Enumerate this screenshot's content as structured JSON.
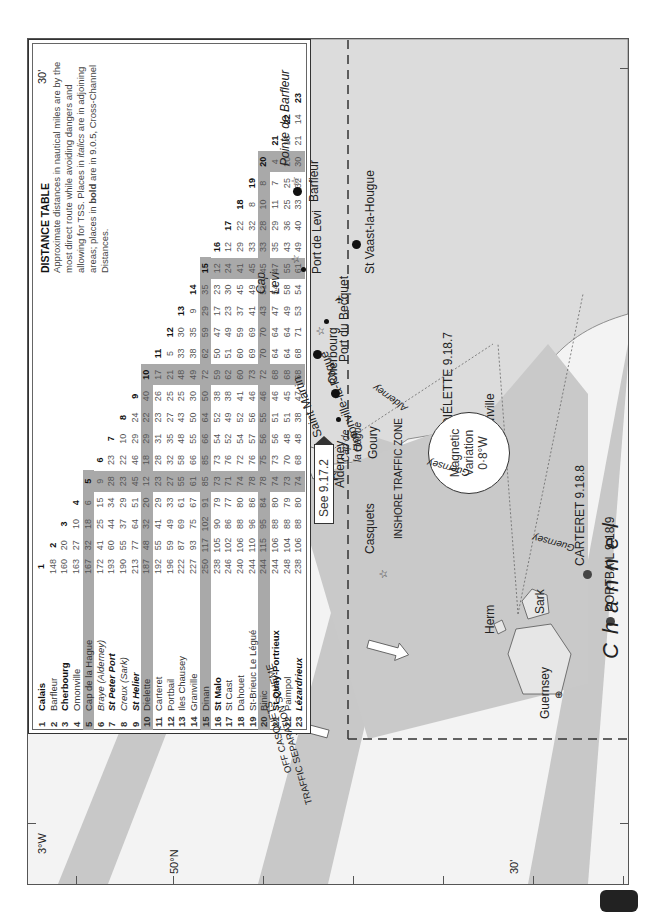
{
  "map": {
    "channel_label": "Channel",
    "lat_labels": {
      "north": "50°N",
      "min30_left": "30'",
      "min30_bottom": "30'"
    },
    "lon_label": "3°W",
    "tss_label_line1": "OFF CASQUETS",
    "tss_label_line2": "TRAFFIC SEPARATION SCHEME",
    "itz_label": "INSHORE TRAFFIC ZONE",
    "magnetic_variation": {
      "line1": "Magnetic",
      "line2": "Variation",
      "line3": "0·8°W"
    },
    "see_ref": "See 9.17.2",
    "places": {
      "pointe_de_barfleur": "Pointe de Barfleur",
      "barfleur": "Barfleur",
      "st_vaast": "St Vaast-la-Hougue",
      "port_de_levi": "Port de Levi",
      "cap_levi_1": "Cap",
      "cap_levi_2": "Levi",
      "port_du_becquet": "Port du Becquet",
      "cherbourg": "Cherbourg",
      "omonville": "Omonville-la-Rogue",
      "anse_st_martin": "Anse de Saint Martin",
      "cap_de_la_hague_1": "Cap de",
      "cap_de_la_hague_2": "la Hague",
      "goury": "Goury",
      "dielette": "DIÉLETTE 9.18.7",
      "flamanville": "Flamanville",
      "carteret": "CARTERET 9.18.8",
      "portbail": "PORTBAIL 9.18.9",
      "alderney": "Alderney",
      "casquets": "Casquets",
      "herm": "Herm",
      "sark": "Sark",
      "guernsey": "Guernsey",
      "route_alderney": "Alderney",
      "route_guernsey_1": "Guernsey",
      "route_guernsey_2": "Guernsey"
    }
  },
  "distance_table": {
    "title": "DISTANCE TABLE",
    "description": "Approximate distances in nautical miles are by the most direct route while avoiding dangers and allowing for TSS. Places in italics are in adjoining areas; places in bold are in 9.0.5, Cross-Channel Distances.",
    "desc_parts": {
      "p1": "Approximate distances in nautical miles are by the most direct route while avoiding dangers and allowing for TSS. Places in ",
      "italics": "italics",
      "p2": " are in adjoining areas; places in ",
      "bold": "bold",
      "p3": " are in 9.0.5, Cross-Channel Distances."
    },
    "places": [
      {
        "n": "1",
        "name": "Calais",
        "style": "bold"
      },
      {
        "n": "2",
        "name": "Barfleur",
        "style": "normal"
      },
      {
        "n": "3",
        "name": "Cherbourg",
        "style": "bold"
      },
      {
        "n": "4",
        "name": "Omonville",
        "style": "normal"
      },
      {
        "n": "5",
        "name": "Cap de la Hague",
        "style": "normal"
      },
      {
        "n": "6",
        "name": "Braye (Alderney)",
        "style": "italic"
      },
      {
        "n": "7",
        "name": "St Peter Port",
        "style": "bolditalic"
      },
      {
        "n": "8",
        "name": "Creux (Sark)",
        "style": "italic"
      },
      {
        "n": "9",
        "name": "St Helier",
        "style": "bolditalic"
      },
      {
        "n": "10",
        "name": "Dielette",
        "style": "normal"
      },
      {
        "n": "11",
        "name": "Carteret",
        "style": "normal"
      },
      {
        "n": "12",
        "name": "Portbail",
        "style": "normal"
      },
      {
        "n": "13",
        "name": "Iles Chausey",
        "style": "normal"
      },
      {
        "n": "14",
        "name": "Granville",
        "style": "normal"
      },
      {
        "n": "15",
        "name": "Dinan",
        "style": "normal"
      },
      {
        "n": "16",
        "name": "St Malo",
        "style": "bold"
      },
      {
        "n": "17",
        "name": "St Cast",
        "style": "normal"
      },
      {
        "n": "18",
        "name": "Dahouet",
        "style": "normal"
      },
      {
        "n": "19",
        "name": "St-Brieuc Le Légué",
        "style": "normal"
      },
      {
        "n": "20",
        "name": "Binic",
        "style": "normal"
      },
      {
        "n": "21",
        "name": "St Quay-Portrieux",
        "style": "bold"
      },
      {
        "n": "22",
        "name": "Paimpol",
        "style": "normal"
      },
      {
        "n": "23",
        "name": "Lézardrieux",
        "style": "bolditalic"
      }
    ],
    "shaded_indices": [
      5,
      10,
      15,
      20
    ],
    "rows": [
      [],
      [
        148
      ],
      [
        160,
        20
      ],
      [
        163,
        27,
        10
      ],
      [
        167,
        32,
        18,
        6
      ],
      [
        172,
        41,
        25,
        15,
        9
      ],
      [
        193,
        60,
        44,
        34,
        28,
        23
      ],
      [
        190,
        55,
        37,
        29,
        23,
        22,
        10
      ],
      [
        213,
        77,
        64,
        51,
        45,
        46,
        29,
        24
      ],
      [
        187,
        48,
        32,
        20,
        12,
        18,
        29,
        22,
        40
      ],
      [
        192,
        55,
        41,
        29,
        23,
        28,
        31,
        23,
        26,
        17
      ],
      [
        196,
        59,
        49,
        33,
        27,
        32,
        35,
        27,
        25,
        21,
        5
      ],
      [
        222,
        87,
        69,
        61,
        55,
        58,
        48,
        43,
        25,
        48,
        33,
        30
      ],
      [
        227,
        93,
        75,
        67,
        61,
        66,
        55,
        50,
        30,
        49,
        38,
        35,
        9
      ],
      [
        250,
        117,
        102,
        91,
        85,
        85,
        66,
        64,
        50,
        72,
        62,
        59,
        29,
        35
      ],
      [
        238,
        105,
        90,
        79,
        73,
        73,
        54,
        52,
        38,
        59,
        50,
        47,
        17,
        23,
        12
      ],
      [
        246,
        102,
        86,
        77,
        71,
        76,
        52,
        49,
        38,
        62,
        51,
        49,
        23,
        30,
        24,
        12
      ],
      [
        240,
        106,
        88,
        80,
        74,
        72,
        54,
        52,
        41,
        60,
        60,
        59,
        37,
        45,
        41,
        29,
        22
      ],
      [
        244,
        110,
        96,
        86,
        78,
        76,
        57,
        56,
        46,
        73,
        69,
        69,
        41,
        49,
        45,
        33,
        32,
        8
      ],
      [
        244,
        115,
        95,
        84,
        78,
        75,
        56,
        55,
        46,
        72,
        70,
        70,
        43,
        51,
        45,
        33,
        28,
        10,
        8
      ],
      [
        244,
        106,
        88,
        80,
        74,
        73,
        56,
        51,
        46,
        68,
        64,
        64,
        47,
        54,
        47,
        35,
        29,
        11,
        7,
        4
      ],
      [
        248,
        104,
        88,
        79,
        73,
        70,
        48,
        51,
        45,
        68,
        64,
        64,
        49,
        58,
        55,
        43,
        36,
        25,
        25,
        20,
        16
      ],
      [
        238,
        106,
        88,
        80,
        74,
        68,
        48,
        38,
        47,
        68,
        68,
        71,
        53,
        54,
        61,
        49,
        40,
        33,
        32,
        30,
        21,
        14
      ]
    ]
  },
  "colors": {
    "land": "#dcdcdc",
    "sea": "#f3f3f3",
    "tss_lane": "#c8c8c8",
    "itz": "#c9c9c9",
    "table_shade": "#a9a9a9"
  }
}
